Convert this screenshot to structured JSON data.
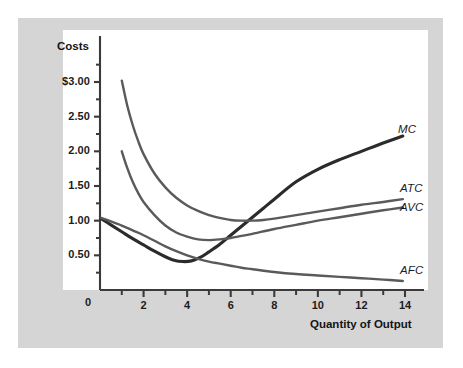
{
  "figure": {
    "background_color": "#ffffff",
    "mat_color": "#d5d5d5",
    "plot_background_color": "#ffffff",
    "axis_color": "#3a3a3a"
  },
  "chart_data": {
    "type": "line",
    "title": "",
    "ylabel": "Costs",
    "xlabel": "Quantity of Output",
    "xlim": [
      0,
      14.6
    ],
    "ylim": [
      0,
      3.35
    ],
    "xticks": [
      0,
      2,
      4,
      6,
      8,
      10,
      12,
      14
    ],
    "xticklabels": [
      "0",
      "2",
      "4",
      "6",
      "8",
      "10",
      "12",
      "14"
    ],
    "xminorticks": [
      1,
      3,
      5,
      7,
      9,
      11,
      13
    ],
    "yticks": [
      0,
      0.5,
      1.0,
      1.5,
      2.0,
      2.5,
      3.0
    ],
    "yticklabels": [
      "0",
      "0.50",
      "1.00",
      "1.50",
      "2.00",
      "2.50",
      "$3.00"
    ],
    "yminorticks": [
      0.25,
      0.75,
      1.25,
      1.75,
      2.25,
      2.75,
      3.25
    ],
    "grid": false,
    "legend": "inline-curve-labels",
    "series": [
      {
        "name": "MC",
        "label": "MC",
        "color": "#2b2b2b",
        "width": 3.1,
        "points": [
          [
            0.05,
            1.03
          ],
          [
            0.5,
            0.94
          ],
          [
            1.0,
            0.84
          ],
          [
            1.5,
            0.74
          ],
          [
            2.0,
            0.65
          ],
          [
            2.5,
            0.56
          ],
          [
            3.0,
            0.48
          ],
          [
            3.4,
            0.43
          ],
          [
            3.8,
            0.41
          ],
          [
            4.2,
            0.42
          ],
          [
            4.6,
            0.47
          ],
          [
            5.0,
            0.55
          ],
          [
            5.5,
            0.66
          ],
          [
            6.0,
            0.79
          ],
          [
            6.5,
            0.92
          ],
          [
            7.0,
            1.05
          ],
          [
            7.5,
            1.18
          ],
          [
            8.0,
            1.31
          ],
          [
            9.0,
            1.56
          ],
          [
            10.0,
            1.74
          ],
          [
            11.0,
            1.88
          ],
          [
            12.0,
            2.0
          ],
          [
            13.0,
            2.12
          ],
          [
            13.9,
            2.22
          ]
        ]
      },
      {
        "name": "ATC",
        "label": "ATC",
        "color": "#5a5a5a",
        "width": 2.4,
        "points": [
          [
            1.0,
            3.02
          ],
          [
            1.25,
            2.66
          ],
          [
            1.5,
            2.38
          ],
          [
            1.75,
            2.15
          ],
          [
            2.0,
            1.96
          ],
          [
            2.5,
            1.68
          ],
          [
            3.0,
            1.48
          ],
          [
            3.5,
            1.33
          ],
          [
            4.0,
            1.22
          ],
          [
            4.5,
            1.14
          ],
          [
            5.0,
            1.08
          ],
          [
            5.5,
            1.04
          ],
          [
            6.0,
            1.01
          ],
          [
            6.5,
            1.0
          ],
          [
            7.0,
            1.0
          ],
          [
            7.5,
            1.01
          ],
          [
            8.0,
            1.03
          ],
          [
            9.0,
            1.08
          ],
          [
            10.0,
            1.13
          ],
          [
            11.0,
            1.18
          ],
          [
            12.0,
            1.23
          ],
          [
            13.0,
            1.27
          ],
          [
            13.9,
            1.31
          ]
        ]
      },
      {
        "name": "AVC",
        "label": "AVC",
        "color": "#5a5a5a",
        "width": 2.4,
        "points": [
          [
            1.0,
            2.0
          ],
          [
            1.25,
            1.76
          ],
          [
            1.5,
            1.56
          ],
          [
            1.75,
            1.4
          ],
          [
            2.0,
            1.27
          ],
          [
            2.5,
            1.08
          ],
          [
            3.0,
            0.93
          ],
          [
            3.5,
            0.83
          ],
          [
            4.0,
            0.77
          ],
          [
            4.5,
            0.73
          ],
          [
            5.0,
            0.72
          ],
          [
            5.5,
            0.73
          ],
          [
            6.0,
            0.75
          ],
          [
            6.5,
            0.78
          ],
          [
            7.0,
            0.81
          ],
          [
            8.0,
            0.88
          ],
          [
            9.0,
            0.94
          ],
          [
            10.0,
            1.0
          ],
          [
            11.0,
            1.05
          ],
          [
            12.0,
            1.1
          ],
          [
            13.0,
            1.15
          ],
          [
            13.9,
            1.19
          ]
        ]
      },
      {
        "name": "AFC",
        "label": "AFC",
        "color": "#5a5a5a",
        "width": 2.4,
        "points": [
          [
            0.05,
            1.04
          ],
          [
            0.5,
            0.99
          ],
          [
            1.0,
            0.93
          ],
          [
            1.5,
            0.86
          ],
          [
            2.0,
            0.79
          ],
          [
            2.5,
            0.71
          ],
          [
            3.0,
            0.63
          ],
          [
            3.5,
            0.56
          ],
          [
            4.0,
            0.5
          ],
          [
            4.5,
            0.45
          ],
          [
            5.0,
            0.41
          ],
          [
            5.5,
            0.38
          ],
          [
            6.0,
            0.35
          ],
          [
            6.5,
            0.32
          ],
          [
            7.0,
            0.3
          ],
          [
            8.0,
            0.26
          ],
          [
            9.0,
            0.23
          ],
          [
            10.0,
            0.21
          ],
          [
            11.0,
            0.19
          ],
          [
            12.0,
            0.17
          ],
          [
            13.0,
            0.15
          ],
          [
            13.9,
            0.13
          ]
        ]
      }
    ],
    "curve_labels": [
      {
        "text": "MC",
        "x": 398,
        "y": 131
      },
      {
        "text": "ATC",
        "x": 400,
        "y": 190
      },
      {
        "text": "AVC",
        "x": 400,
        "y": 209
      },
      {
        "text": "AFC",
        "x": 400,
        "y": 272
      }
    ]
  }
}
